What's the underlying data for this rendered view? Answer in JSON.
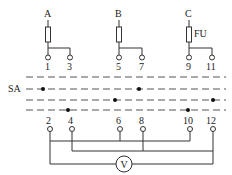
{
  "diagram": {
    "type": "voltmeter-switch-wiring",
    "phases": [
      {
        "label": "A",
        "x": 48,
        "fuse": true,
        "terminals": [
          {
            "num": "1",
            "x": 48
          },
          {
            "num": "3",
            "x": 70
          }
        ]
      },
      {
        "label": "B",
        "x": 119,
        "fuse": true,
        "terminals": [
          {
            "num": "5",
            "x": 119
          },
          {
            "num": "7",
            "x": 142
          }
        ]
      },
      {
        "label": "C",
        "x": 189,
        "fuse": true,
        "fuse_label": "FU",
        "terminals": [
          {
            "num": "9",
            "x": 189
          },
          {
            "num": "11",
            "x": 212
          }
        ]
      }
    ],
    "switch_label": "SA",
    "fuse_label": "FU",
    "contact_lines": [
      {
        "y": 77,
        "dots": []
      },
      {
        "y": 89,
        "dots": [
          43,
          139
        ]
      },
      {
        "y": 100,
        "dots": [
          115,
          213
        ]
      },
      {
        "y": 110,
        "dots": [
          68,
          188
        ]
      }
    ],
    "bottom_terminals": [
      {
        "num": "2",
        "x": 50
      },
      {
        "num": "4",
        "x": 72
      },
      {
        "num": "6",
        "x": 120
      },
      {
        "num": "8",
        "x": 143
      },
      {
        "num": "10",
        "x": 190
      },
      {
        "num": "12",
        "x": 213
      }
    ],
    "buses": [
      {
        "connects": [
          "2",
          "6",
          "10"
        ],
        "y": 141
      },
      {
        "connects": [
          "4",
          "8",
          "12"
        ],
        "y": 151
      }
    ],
    "meter": {
      "label": "V",
      "name": "voltmeter",
      "connects": [
        "2",
        "12"
      ]
    },
    "labels": {
      "A": "A",
      "B": "B",
      "C": "C",
      "FU": "FU",
      "SA": "SA",
      "V": "V",
      "t1": "1",
      "t3": "3",
      "t5": "5",
      "t7": "7",
      "t9": "9",
      "t11": "11",
      "t2": "2",
      "t4": "4",
      "t6": "6",
      "t8": "8",
      "t10": "10",
      "t12": "12"
    }
  }
}
